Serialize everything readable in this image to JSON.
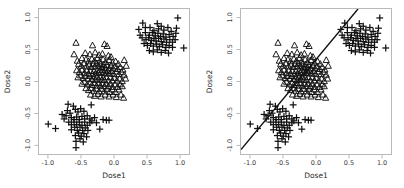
{
  "figure": {
    "width": 404,
    "height": 188,
    "background": "#ffffff",
    "ink": "#111111",
    "frame_color": "#b9b9b9"
  },
  "panels": [
    {
      "id": "left",
      "name": "scatter-panel-left",
      "show_line": false
    },
    {
      "id": "right",
      "name": "scatter-panel-right",
      "show_line": true
    }
  ],
  "chart_data": {
    "type": "scatter",
    "title": "",
    "xlabel": "Dose1",
    "ylabel": "Dose2",
    "xlim": [
      -1.15,
      1.15
    ],
    "ylim": [
      -1.15,
      1.15
    ],
    "grid": false,
    "legend": "none",
    "xticks": [
      -1.0,
      -0.5,
      0.0,
      0.5,
      1.0
    ],
    "xticklabels": [
      "-1.0",
      "-0.5",
      "0.0",
      "0.5",
      "1.0"
    ],
    "yticks": [
      -1.0,
      -0.5,
      0.0,
      0.5,
      1.0
    ],
    "yticklabels": [
      "-1.0",
      "-0.5",
      "0.0",
      "0.5",
      "1.0"
    ],
    "panel_count": 2,
    "annotations": [
      {
        "type": "line",
        "name": "diagonal-reference-line",
        "panel": "right",
        "x0": -1.15,
        "y0": -1.05,
        "x1": 0.62,
        "y1": 1.15,
        "color": "#111111",
        "width": 1.4
      }
    ],
    "series": [
      {
        "name": "cluster-center-triangles",
        "marker": "triangle",
        "color": "#111111",
        "size": 3.1,
        "center": [
          -0.25,
          0.2
        ],
        "points": [
          [
            -0.59,
            0.62
          ],
          [
            -0.34,
            0.58
          ],
          [
            -0.16,
            0.6
          ],
          [
            -0.12,
            0.57
          ],
          [
            -0.45,
            0.46
          ],
          [
            -0.38,
            0.44
          ],
          [
            -0.3,
            0.47
          ],
          [
            -0.24,
            0.43
          ],
          [
            -0.19,
            0.45
          ],
          [
            -0.1,
            0.42
          ],
          [
            -0.06,
            0.4
          ],
          [
            -0.5,
            0.38
          ],
          [
            -0.44,
            0.36
          ],
          [
            -0.4,
            0.33
          ],
          [
            -0.35,
            0.37
          ],
          [
            -0.31,
            0.34
          ],
          [
            -0.27,
            0.38
          ],
          [
            -0.23,
            0.33
          ],
          [
            -0.18,
            0.36
          ],
          [
            -0.14,
            0.32
          ],
          [
            -0.09,
            0.35
          ],
          [
            -0.04,
            0.31
          ],
          [
            0.01,
            0.33
          ],
          [
            0.05,
            0.29
          ],
          [
            -0.55,
            0.29
          ],
          [
            -0.51,
            0.26
          ],
          [
            -0.47,
            0.3
          ],
          [
            -0.43,
            0.25
          ],
          [
            -0.39,
            0.28
          ],
          [
            -0.36,
            0.24
          ],
          [
            -0.33,
            0.29
          ],
          [
            -0.3,
            0.25
          ],
          [
            -0.28,
            0.3
          ],
          [
            -0.25,
            0.26
          ],
          [
            -0.22,
            0.29
          ],
          [
            -0.2,
            0.24
          ],
          [
            -0.17,
            0.28
          ],
          [
            -0.15,
            0.23
          ],
          [
            -0.12,
            0.27
          ],
          [
            -0.09,
            0.22
          ],
          [
            -0.06,
            0.26
          ],
          [
            -0.03,
            0.22
          ],
          [
            0.0,
            0.25
          ],
          [
            0.04,
            0.21
          ],
          [
            0.08,
            0.24
          ],
          [
            0.12,
            0.2
          ],
          [
            -0.58,
            0.19
          ],
          [
            -0.54,
            0.16
          ],
          [
            -0.5,
            0.2
          ],
          [
            -0.46,
            0.15
          ],
          [
            -0.43,
            0.19
          ],
          [
            -0.4,
            0.14
          ],
          [
            -0.37,
            0.18
          ],
          [
            -0.34,
            0.13
          ],
          [
            -0.32,
            0.18
          ],
          [
            -0.29,
            0.14
          ],
          [
            -0.27,
            0.19
          ],
          [
            -0.25,
            0.15
          ],
          [
            -0.23,
            0.2
          ],
          [
            -0.21,
            0.16
          ],
          [
            -0.19,
            0.2
          ],
          [
            -0.17,
            0.15
          ],
          [
            -0.15,
            0.19
          ],
          [
            -0.13,
            0.14
          ],
          [
            -0.11,
            0.18
          ],
          [
            -0.08,
            0.14
          ],
          [
            -0.05,
            0.18
          ],
          [
            -0.02,
            0.13
          ],
          [
            0.02,
            0.17
          ],
          [
            0.06,
            0.13
          ],
          [
            0.1,
            0.16
          ],
          [
            0.14,
            0.12
          ],
          [
            -0.56,
            0.08
          ],
          [
            -0.52,
            0.11
          ],
          [
            -0.48,
            0.07
          ],
          [
            -0.45,
            0.1
          ],
          [
            -0.41,
            0.06
          ],
          [
            -0.38,
            0.1
          ],
          [
            -0.35,
            0.05
          ],
          [
            -0.32,
            0.09
          ],
          [
            -0.3,
            0.04
          ],
          [
            -0.27,
            0.09
          ],
          [
            -0.25,
            0.05
          ],
          [
            -0.22,
            0.09
          ],
          [
            -0.2,
            0.04
          ],
          [
            -0.18,
            0.08
          ],
          [
            -0.16,
            0.04
          ],
          [
            -0.13,
            0.08
          ],
          [
            -0.1,
            0.03
          ],
          [
            -0.07,
            0.08
          ],
          [
            -0.04,
            0.03
          ],
          [
            -0.01,
            0.07
          ],
          [
            0.03,
            0.03
          ],
          [
            0.07,
            0.06
          ],
          [
            0.11,
            0.02
          ],
          [
            -0.5,
            -0.02
          ],
          [
            -0.46,
            0.01
          ],
          [
            -0.42,
            -0.03
          ],
          [
            -0.38,
            0.0
          ],
          [
            -0.35,
            -0.04
          ],
          [
            -0.31,
            -0.01
          ],
          [
            -0.28,
            -0.05
          ],
          [
            -0.25,
            -0.01
          ],
          [
            -0.22,
            -0.05
          ],
          [
            -0.19,
            -0.02
          ],
          [
            -0.16,
            -0.06
          ],
          [
            -0.13,
            -0.02
          ],
          [
            -0.1,
            -0.06
          ],
          [
            -0.07,
            -0.02
          ],
          [
            -0.04,
            -0.07
          ],
          [
            0.0,
            -0.03
          ],
          [
            0.04,
            -0.07
          ],
          [
            0.08,
            -0.03
          ],
          [
            -0.44,
            -0.09
          ],
          [
            -0.4,
            -0.12
          ],
          [
            -0.36,
            -0.09
          ],
          [
            -0.32,
            -0.13
          ],
          [
            -0.28,
            -0.1
          ],
          [
            -0.24,
            -0.14
          ],
          [
            -0.2,
            -0.1
          ],
          [
            -0.16,
            -0.14
          ],
          [
            -0.12,
            -0.1
          ],
          [
            -0.08,
            -0.15
          ],
          [
            -0.04,
            -0.11
          ],
          [
            0.01,
            -0.15
          ],
          [
            0.06,
            -0.11
          ],
          [
            -0.37,
            -0.19
          ],
          [
            -0.31,
            -0.21
          ],
          [
            -0.26,
            -0.18
          ],
          [
            -0.21,
            -0.22
          ],
          [
            -0.15,
            -0.19
          ],
          [
            -0.09,
            -0.22
          ],
          [
            -0.03,
            -0.19
          ],
          [
            0.02,
            -0.23
          ],
          [
            0.09,
            -0.19
          ],
          [
            0.13,
            -0.24
          ],
          [
            -0.62,
            0.44
          ],
          [
            -0.57,
            0.34
          ],
          [
            0.14,
            0.35
          ],
          [
            0.17,
            0.26
          ],
          [
            0.16,
            0.06
          ],
          [
            0.11,
            -0.06
          ]
        ]
      },
      {
        "name": "cluster-upper-right-plus",
        "marker": "plus",
        "color": "#111111",
        "size": 3.4,
        "center": [
          0.66,
          0.7
        ],
        "points": [
          [
            0.95,
            1.01
          ],
          [
            0.42,
            0.93
          ],
          [
            0.64,
            0.92
          ],
          [
            0.7,
            0.88
          ],
          [
            0.36,
            0.83
          ],
          [
            0.53,
            0.86
          ],
          [
            0.59,
            0.81
          ],
          [
            0.66,
            0.84
          ],
          [
            0.74,
            0.82
          ],
          [
            0.8,
            0.86
          ],
          [
            0.85,
            0.8
          ],
          [
            0.46,
            0.78
          ],
          [
            0.52,
            0.74
          ],
          [
            0.57,
            0.78
          ],
          [
            0.61,
            0.73
          ],
          [
            0.65,
            0.77
          ],
          [
            0.69,
            0.72
          ],
          [
            0.73,
            0.76
          ],
          [
            0.77,
            0.71
          ],
          [
            0.82,
            0.75
          ],
          [
            0.88,
            0.72
          ],
          [
            0.92,
            0.77
          ],
          [
            0.41,
            0.7
          ],
          [
            0.47,
            0.67
          ],
          [
            0.51,
            0.7
          ],
          [
            0.55,
            0.66
          ],
          [
            0.59,
            0.69
          ],
          [
            0.62,
            0.65
          ],
          [
            0.66,
            0.69
          ],
          [
            0.7,
            0.64
          ],
          [
            0.74,
            0.68
          ],
          [
            0.78,
            0.63
          ],
          [
            0.83,
            0.67
          ],
          [
            0.87,
            0.63
          ],
          [
            0.91,
            0.67
          ],
          [
            1.04,
            0.54
          ],
          [
            0.44,
            0.61
          ],
          [
            0.49,
            0.58
          ],
          [
            0.54,
            0.61
          ],
          [
            0.58,
            0.57
          ],
          [
            0.63,
            0.6
          ],
          [
            0.67,
            0.56
          ],
          [
            0.72,
            0.59
          ],
          [
            0.77,
            0.55
          ],
          [
            0.82,
            0.58
          ],
          [
            0.87,
            0.55
          ],
          [
            0.52,
            0.5
          ],
          [
            0.58,
            0.48
          ],
          [
            0.64,
            0.51
          ],
          [
            0.7,
            0.47
          ],
          [
            0.76,
            0.5
          ],
          [
            0.81,
            0.46
          ],
          [
            0.46,
            0.86
          ],
          [
            0.38,
            0.74
          ],
          [
            0.93,
            0.85
          ]
        ]
      },
      {
        "name": "cluster-lower-left-plus",
        "marker": "plus",
        "color": "#111111",
        "size": 3.4,
        "center": [
          -0.55,
          -0.6
        ],
        "points": [
          [
            -1.01,
            -0.65
          ],
          [
            -0.9,
            -0.72
          ],
          [
            -0.71,
            -0.34
          ],
          [
            -0.63,
            -0.37
          ],
          [
            -0.72,
            -0.44
          ],
          [
            -0.68,
            -0.48
          ],
          [
            -0.74,
            -0.52
          ],
          [
            -0.66,
            -0.55
          ],
          [
            -0.6,
            -0.42
          ],
          [
            -0.56,
            -0.46
          ],
          [
            -0.52,
            -0.41
          ],
          [
            -0.47,
            -0.45
          ],
          [
            -0.36,
            -0.35
          ],
          [
            -0.62,
            -0.58
          ],
          [
            -0.58,
            -0.54
          ],
          [
            -0.54,
            -0.58
          ],
          [
            -0.5,
            -0.53
          ],
          [
            -0.46,
            -0.57
          ],
          [
            -0.42,
            -0.52
          ],
          [
            -0.38,
            -0.57
          ],
          [
            -0.7,
            -0.62
          ],
          [
            -0.66,
            -0.66
          ],
          [
            -0.62,
            -0.62
          ],
          [
            -0.58,
            -0.66
          ],
          [
            -0.54,
            -0.62
          ],
          [
            -0.5,
            -0.67
          ],
          [
            -0.46,
            -0.62
          ],
          [
            -0.42,
            -0.67
          ],
          [
            -0.38,
            -0.63
          ],
          [
            -0.18,
            -0.58
          ],
          [
            -0.13,
            -0.59
          ],
          [
            -0.09,
            -0.59
          ],
          [
            -0.66,
            -0.74
          ],
          [
            -0.61,
            -0.7
          ],
          [
            -0.57,
            -0.75
          ],
          [
            -0.53,
            -0.7
          ],
          [
            -0.49,
            -0.75
          ],
          [
            -0.45,
            -0.71
          ],
          [
            -0.41,
            -0.75
          ],
          [
            -0.23,
            -0.73
          ],
          [
            -0.6,
            -0.83
          ],
          [
            -0.55,
            -0.79
          ],
          [
            -0.51,
            -0.84
          ],
          [
            -0.47,
            -0.8
          ],
          [
            -0.43,
            -0.85
          ],
          [
            -0.59,
            -0.92
          ],
          [
            -0.53,
            -0.88
          ],
          [
            -0.48,
            -0.93
          ],
          [
            -0.59,
            -1.02
          ],
          [
            -0.77,
            -0.57
          ],
          [
            -0.8,
            -0.5
          ],
          [
            -0.35,
            -0.6
          ],
          [
            -0.31,
            -0.55
          ],
          [
            -0.28,
            -0.63
          ]
        ]
      }
    ]
  }
}
